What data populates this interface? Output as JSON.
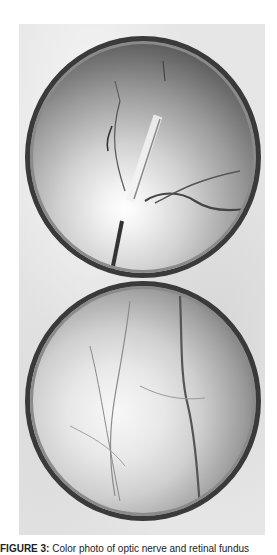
{
  "figure": {
    "panels": [
      {
        "id": "top",
        "description": "Fundus photograph showing optic disc with retinal vessels"
      },
      {
        "id": "bottom",
        "description": "Fundus photograph showing retina with vessels"
      }
    ],
    "caption": {
      "label": "FIGURE 3:",
      "text": " Color photo of optic nerve and retinal fundus"
    }
  }
}
